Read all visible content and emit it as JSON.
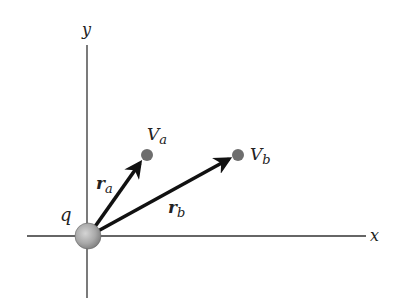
{
  "diagram": {
    "axes": {
      "x_label": "x",
      "y_label": "y",
      "color": "#333333"
    },
    "charge": {
      "label": "q",
      "fill": "#a8a8a8"
    },
    "points": [
      {
        "id": "a",
        "label": "V",
        "subscript": "a",
        "color": "#6e6e6e"
      },
      {
        "id": "b",
        "label": "V",
        "subscript": "b",
        "color": "#6e6e6e"
      }
    ],
    "vectors": [
      {
        "id": "ra",
        "label": "r",
        "subscript": "a"
      },
      {
        "id": "rb",
        "label": "r",
        "subscript": "b"
      }
    ]
  }
}
